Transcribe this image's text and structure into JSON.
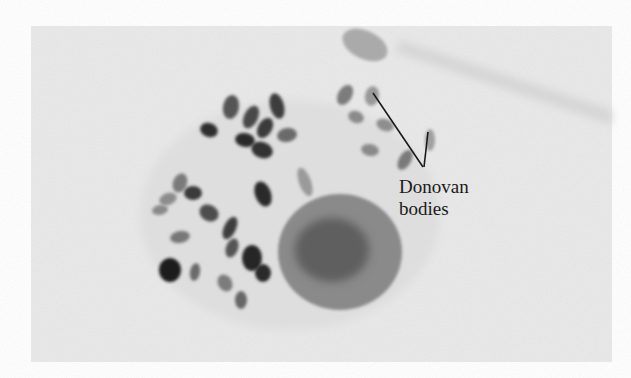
{
  "figure": {
    "photo_frame": {
      "x": 31,
      "y": 26,
      "width": 581,
      "height": 336,
      "background": "#e9e9e9"
    },
    "annotation": {
      "line1": "Donovan",
      "line2": "bodies",
      "text_x": 399,
      "text_y1": 176,
      "text_y2": 198,
      "pointer_lines": [
        {
          "x1": 373,
          "y1": 93,
          "x2": 423,
          "y2": 167
        },
        {
          "x1": 428,
          "y1": 132,
          "x2": 424,
          "y2": 167
        }
      ],
      "color": "#1a1a1a"
    },
    "nucleus": {
      "cx": 340,
      "cy": 252,
      "rx": 62,
      "ry": 58,
      "fill": "#8a8a8a",
      "inner_fill": "#5e5e5e"
    },
    "bodies": [
      {
        "cx": 209,
        "cy": 130,
        "rx": 9,
        "ry": 7,
        "rot": 20,
        "shade": "#2e2e2e"
      },
      {
        "cx": 231,
        "cy": 107,
        "rx": 8,
        "ry": 12,
        "rot": 10,
        "shade": "#555555"
      },
      {
        "cx": 251,
        "cy": 117,
        "rx": 7,
        "ry": 12,
        "rot": 25,
        "shade": "#4a4a4a"
      },
      {
        "cx": 265,
        "cy": 128,
        "rx": 7,
        "ry": 11,
        "rot": 30,
        "shade": "#3a3a3a"
      },
      {
        "cx": 277,
        "cy": 106,
        "rx": 7,
        "ry": 13,
        "rot": -15,
        "shade": "#3c3c3c"
      },
      {
        "cx": 245,
        "cy": 140,
        "rx": 10,
        "ry": 7,
        "rot": 10,
        "shade": "#2a2a2a"
      },
      {
        "cx": 262,
        "cy": 150,
        "rx": 11,
        "ry": 8,
        "rot": 20,
        "shade": "#333333"
      },
      {
        "cx": 287,
        "cy": 135,
        "rx": 10,
        "ry": 7,
        "rot": -10,
        "shade": "#6a6a6a"
      },
      {
        "cx": 263,
        "cy": 194,
        "rx": 8,
        "ry": 13,
        "rot": -20,
        "shade": "#2c2c2c"
      },
      {
        "cx": 305,
        "cy": 182,
        "rx": 6,
        "ry": 15,
        "rot": -20,
        "shade": "#9a9a9a"
      },
      {
        "cx": 180,
        "cy": 183,
        "rx": 7,
        "ry": 10,
        "rot": 20,
        "shade": "#7a7a7a"
      },
      {
        "cx": 193,
        "cy": 193,
        "rx": 9,
        "ry": 7,
        "rot": 0,
        "shade": "#3a3a3a"
      },
      {
        "cx": 168,
        "cy": 199,
        "rx": 9,
        "ry": 6,
        "rot": -20,
        "shade": "#8c8c8c"
      },
      {
        "cx": 160,
        "cy": 210,
        "rx": 8,
        "ry": 5,
        "rot": -10,
        "shade": "#8a8a8a"
      },
      {
        "cx": 209,
        "cy": 213,
        "rx": 10,
        "ry": 8,
        "rot": 30,
        "shade": "#4e4e4e"
      },
      {
        "cx": 180,
        "cy": 237,
        "rx": 10,
        "ry": 6,
        "rot": -10,
        "shade": "#777777"
      },
      {
        "cx": 230,
        "cy": 228,
        "rx": 6,
        "ry": 12,
        "rot": 25,
        "shade": "#3d3d3d"
      },
      {
        "cx": 232,
        "cy": 248,
        "rx": 6,
        "ry": 10,
        "rot": 20,
        "shade": "#555555"
      },
      {
        "cx": 252,
        "cy": 258,
        "rx": 10,
        "ry": 13,
        "rot": 0,
        "shade": "#252525"
      },
      {
        "cx": 263,
        "cy": 273,
        "rx": 8,
        "ry": 9,
        "rot": 0,
        "shade": "#2a2a2a"
      },
      {
        "cx": 170,
        "cy": 270,
        "rx": 11,
        "ry": 12,
        "rot": 0,
        "shade": "#1c1c1c"
      },
      {
        "cx": 195,
        "cy": 272,
        "rx": 5,
        "ry": 9,
        "rot": 10,
        "shade": "#6a6a6a"
      },
      {
        "cx": 225,
        "cy": 283,
        "rx": 7,
        "ry": 9,
        "rot": -30,
        "shade": "#7c7c7c"
      },
      {
        "cx": 241,
        "cy": 300,
        "rx": 6,
        "ry": 9,
        "rot": 0,
        "shade": "#666666"
      },
      {
        "cx": 345,
        "cy": 95,
        "rx": 7,
        "ry": 11,
        "rot": 30,
        "shade": "#7c7c7c"
      },
      {
        "cx": 372,
        "cy": 96,
        "rx": 7,
        "ry": 10,
        "rot": 10,
        "shade": "#999999"
      },
      {
        "cx": 356,
        "cy": 117,
        "rx": 8,
        "ry": 6,
        "rot": 20,
        "shade": "#8a8a8a"
      },
      {
        "cx": 385,
        "cy": 125,
        "rx": 9,
        "ry": 6,
        "rot": 20,
        "shade": "#8e8e8e"
      },
      {
        "cx": 370,
        "cy": 150,
        "rx": 9,
        "ry": 6,
        "rot": 10,
        "shade": "#8a8a8a"
      },
      {
        "cx": 405,
        "cy": 160,
        "rx": 6,
        "ry": 11,
        "rot": 30,
        "shade": "#7a7a7a"
      },
      {
        "cx": 430,
        "cy": 140,
        "rx": 5,
        "ry": 11,
        "rot": 0,
        "shade": "#a0a0a0"
      },
      {
        "cx": 365,
        "cy": 45,
        "rx": 24,
        "ry": 14,
        "rot": 25,
        "shade": "#aaaaaa"
      }
    ]
  }
}
